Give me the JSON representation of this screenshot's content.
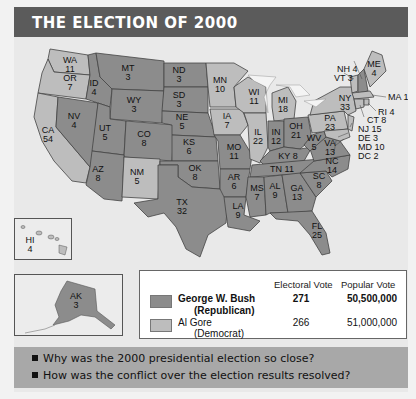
{
  "title": "THE ELECTION OF 2000",
  "colors": {
    "republican": "#8c8c8c",
    "democrat": "#bdbdbd",
    "title_bar": "#5b5b5b",
    "question_band": "#a8a8a8",
    "background": "#e9e9e9"
  },
  "states": [
    {
      "abbr": "WA",
      "ev": "11",
      "party": "democrat"
    },
    {
      "abbr": "OR",
      "ev": "7",
      "party": "democrat"
    },
    {
      "abbr": "CA",
      "ev": "54",
      "party": "democrat"
    },
    {
      "abbr": "NV",
      "ev": "4",
      "party": "republican"
    },
    {
      "abbr": "ID",
      "ev": "4",
      "party": "republican"
    },
    {
      "abbr": "MT",
      "ev": "3",
      "party": "republican"
    },
    {
      "abbr": "WY",
      "ev": "3",
      "party": "republican"
    },
    {
      "abbr": "UT",
      "ev": "5",
      "party": "republican"
    },
    {
      "abbr": "CO",
      "ev": "8",
      "party": "republican"
    },
    {
      "abbr": "AZ",
      "ev": "8",
      "party": "republican"
    },
    {
      "abbr": "NM",
      "ev": "5",
      "party": "democrat"
    },
    {
      "abbr": "ND",
      "ev": "3",
      "party": "republican"
    },
    {
      "abbr": "SD",
      "ev": "3",
      "party": "republican"
    },
    {
      "abbr": "NE",
      "ev": "5",
      "party": "republican"
    },
    {
      "abbr": "KS",
      "ev": "6",
      "party": "republican"
    },
    {
      "abbr": "OK",
      "ev": "8",
      "party": "republican"
    },
    {
      "abbr": "TX",
      "ev": "32",
      "party": "republican"
    },
    {
      "abbr": "MN",
      "ev": "10",
      "party": "democrat"
    },
    {
      "abbr": "IA",
      "ev": "7",
      "party": "democrat"
    },
    {
      "abbr": "MO",
      "ev": "11",
      "party": "republican"
    },
    {
      "abbr": "AR",
      "ev": "6",
      "party": "republican"
    },
    {
      "abbr": "LA",
      "ev": "9",
      "party": "republican"
    },
    {
      "abbr": "WI",
      "ev": "11",
      "party": "democrat"
    },
    {
      "abbr": "IL",
      "ev": "22",
      "party": "democrat"
    },
    {
      "abbr": "MI",
      "ev": "18",
      "party": "democrat"
    },
    {
      "abbr": "IN",
      "ev": "12",
      "party": "republican"
    },
    {
      "abbr": "OH",
      "ev": "21",
      "party": "republican"
    },
    {
      "abbr": "KY",
      "ev": "8",
      "party": "republican"
    },
    {
      "abbr": "TN",
      "ev": "11",
      "party": "republican"
    },
    {
      "abbr": "MS",
      "ev": "7",
      "party": "republican"
    },
    {
      "abbr": "AL",
      "ev": "9",
      "party": "republican"
    },
    {
      "abbr": "GA",
      "ev": "13",
      "party": "republican"
    },
    {
      "abbr": "FL",
      "ev": "25",
      "party": "republican"
    },
    {
      "abbr": "SC",
      "ev": "8",
      "party": "republican"
    },
    {
      "abbr": "NC",
      "ev": "14",
      "party": "republican"
    },
    {
      "abbr": "VA",
      "ev": "13",
      "party": "republican"
    },
    {
      "abbr": "WV",
      "ev": "5",
      "party": "republican"
    },
    {
      "abbr": "PA",
      "ev": "23",
      "party": "democrat"
    },
    {
      "abbr": "NY",
      "ev": "33",
      "party": "democrat"
    },
    {
      "abbr": "ME",
      "ev": "4",
      "party": "democrat"
    },
    {
      "abbr": "NH",
      "ev": "4",
      "party": "republican"
    },
    {
      "abbr": "VT",
      "ev": "3",
      "party": "democrat"
    },
    {
      "abbr": "MA",
      "ev": "12",
      "party": "democrat"
    },
    {
      "abbr": "RI",
      "ev": "4",
      "party": "democrat"
    },
    {
      "abbr": "CT",
      "ev": "8",
      "party": "democrat"
    },
    {
      "abbr": "NJ",
      "ev": "15",
      "party": "democrat"
    },
    {
      "abbr": "DE",
      "ev": "3",
      "party": "democrat"
    },
    {
      "abbr": "MD",
      "ev": "10",
      "party": "democrat"
    },
    {
      "abbr": "DC",
      "ev": "2",
      "party": "democrat"
    },
    {
      "abbr": "HI",
      "ev": "4",
      "party": "democrat"
    },
    {
      "abbr": "AK",
      "ev": "3",
      "party": "republican"
    }
  ],
  "labels": {
    "WA": "WA",
    "WA_ev": "11",
    "OR": "OR",
    "OR_ev": "7",
    "CA": "CA",
    "CA_ev": "54",
    "NV": "NV",
    "NV_ev": "4",
    "ID": "ID",
    "ID_ev": "4",
    "MT": "MT",
    "MT_ev": "3",
    "WY": "WY",
    "WY_ev": "3",
    "UT": "UT",
    "UT_ev": "5",
    "CO": "CO",
    "CO_ev": "8",
    "AZ": "AZ",
    "AZ_ev": "8",
    "NM": "NM",
    "NM_ev": "5",
    "ND": "ND",
    "ND_ev": "3",
    "SD": "SD",
    "SD_ev": "3",
    "NE": "NE",
    "NE_ev": "5",
    "KS": "KS",
    "KS_ev": "6",
    "OK": "OK",
    "OK_ev": "8",
    "TX": "TX",
    "TX_ev": "32",
    "MN": "MN",
    "MN_ev": "10",
    "IA": "IA",
    "IA_ev": "7",
    "MO": "MO",
    "MO_ev": "11",
    "AR": "AR",
    "AR_ev": "6",
    "LA": "LA",
    "LA_ev": "9",
    "WI": "WI",
    "WI_ev": "11",
    "IL": "IL",
    "IL_ev": "22",
    "MI": "MI",
    "MI_ev": "18",
    "IN": "IN",
    "IN_ev": "12",
    "OH": "OH",
    "OH_ev": "21",
    "KY": "KY 8",
    "TN": "TN 11",
    "MS": "MS",
    "MS_ev": "7",
    "AL": "AL",
    "AL_ev": "9",
    "GA": "GA",
    "GA_ev": "13",
    "FL": "FL",
    "FL_ev": "25",
    "SC": "SC",
    "SC_ev": "8",
    "NC": "NC",
    "NC_ev": "14",
    "VA": "VA",
    "VA_ev": "13",
    "WV": "WV",
    "WV_ev": "5",
    "PA": "PA",
    "PA_ev": "23",
    "NY": "NY",
    "NY_ev": "33",
    "ME": "ME",
    "ME_ev": "4",
    "NH": "NH 4",
    "VT": "VT 3",
    "MA": "MA 12",
    "RI": "RI 4",
    "CT": "CT 8",
    "NJ": "NJ 15",
    "DE": "DE 3",
    "MD": "MD 10",
    "DC": "DC 2",
    "HI": "HI",
    "HI_ev": "4",
    "AK": "AK",
    "AK_ev": "3"
  },
  "legend": {
    "col_electoral": "Electoral Vote",
    "col_popular": "Popular Vote",
    "rows": [
      {
        "name": "George W. Bush",
        "party": "(Republican)",
        "electoral": "271",
        "popular": "50,500,000",
        "bold": true
      },
      {
        "name": "Al Gore",
        "party": "(Democrat)",
        "electoral": "266",
        "popular": "51,000,000",
        "bold": false
      }
    ]
  },
  "questions": [
    "Why was the 2000 presidential election so close?",
    "How was the conflict over the election results resolved?"
  ]
}
